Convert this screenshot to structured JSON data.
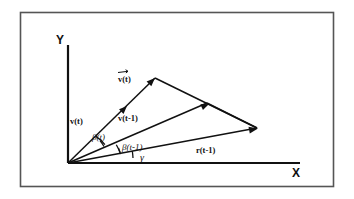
{
  "figure": {
    "name": "vector-angle-diagram",
    "background_color": "#ffffff",
    "ink_color": "#111111",
    "frame": {
      "border_color": "#555555",
      "x": 20,
      "y": 12,
      "width": 314,
      "height": 175
    },
    "axes": {
      "x_label": "X",
      "y_label": "Y",
      "origin": {
        "x": 68,
        "y": 163
      },
      "x_end": {
        "x": 300,
        "y": 163
      },
      "y_end": {
        "x": 68,
        "y": 45
      }
    },
    "vectors": [
      {
        "id": "v-t-prime",
        "label": "v(t)",
        "label_accent": "arrow-overbar",
        "label_x": 122,
        "label_y": 78,
        "tip_x": 155,
        "tip_y": 78,
        "arrow_mid_x": 125,
        "arrow_mid_y": 105
      },
      {
        "id": "v-t",
        "label": "v(t)",
        "label_x": 78,
        "label_y": 121,
        "tip_x": 155,
        "tip_y": 78
      },
      {
        "id": "v-t-minus-1",
        "label": "v(t-1)",
        "label_x": 122,
        "label_y": 118,
        "tip_x": 207,
        "tip_y": 103,
        "arrow_mid_x": 200,
        "arrow_mid_y": 106
      },
      {
        "id": "r-t-minus-1",
        "label": "r(t-1)",
        "label_x": 200,
        "label_y": 150,
        "tip_x": 257,
        "tip_y": 128
      }
    ],
    "angles": [
      {
        "id": "beta-t",
        "label": "β(t)",
        "label_x": 96,
        "label_y": 137
      },
      {
        "id": "beta-t-minus-1",
        "label": "β(t-1)",
        "label_x": 126,
        "label_y": 147
      },
      {
        "id": "gamma",
        "label": "γ",
        "label_x": 142,
        "label_y": 159
      }
    ],
    "arcs": [
      {
        "id": "arc-beta-t",
        "r": 38
      },
      {
        "id": "arc-beta-t-minus-1",
        "r": 52
      },
      {
        "id": "arc-gamma",
        "r": 65
      }
    ]
  }
}
